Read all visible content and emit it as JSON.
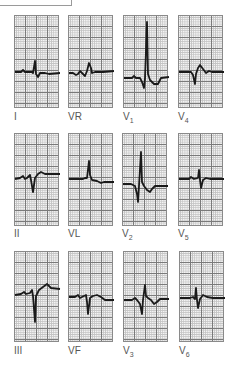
{
  "figure": {
    "grid": {
      "major_color": "#7a7a7a",
      "minor_color": "#c4c4c4",
      "trace_color": "#1a1a1a"
    },
    "leads": [
      {
        "id": "I",
        "label": "I",
        "sub": "",
        "row": 0,
        "col": 0
      },
      {
        "id": "VR",
        "label": "VR",
        "sub": "",
        "row": 0,
        "col": 1
      },
      {
        "id": "V1",
        "label": "V",
        "sub": "1",
        "row": 0,
        "col": 2
      },
      {
        "id": "V4",
        "label": "V",
        "sub": "4",
        "row": 0,
        "col": 3
      },
      {
        "id": "II",
        "label": "II",
        "sub": "",
        "row": 1,
        "col": 0
      },
      {
        "id": "VL",
        "label": "VL",
        "sub": "",
        "row": 1,
        "col": 1
      },
      {
        "id": "V2",
        "label": "V",
        "sub": "2",
        "row": 1,
        "col": 2
      },
      {
        "id": "V5",
        "label": "V",
        "sub": "5",
        "row": 1,
        "col": 3
      },
      {
        "id": "III",
        "label": "III",
        "sub": "",
        "row": 2,
        "col": 0
      },
      {
        "id": "VF",
        "label": "VF",
        "sub": "",
        "row": 2,
        "col": 1
      },
      {
        "id": "V3",
        "label": "V",
        "sub": "3",
        "row": 2,
        "col": 2
      },
      {
        "id": "V6",
        "label": "V",
        "sub": "6",
        "row": 2,
        "col": 3
      }
    ]
  }
}
